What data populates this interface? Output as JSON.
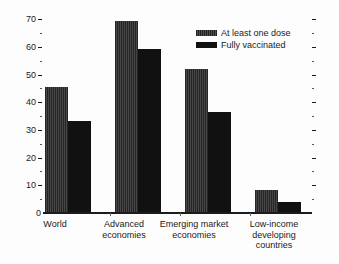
{
  "chart_data": {
    "type": "bar",
    "title": "",
    "subtitle": "",
    "xlabel": "",
    "ylabel": "",
    "ylim": [
      0,
      70
    ],
    "y_ticks": [
      0,
      10,
      20,
      30,
      40,
      50,
      60,
      70
    ],
    "y_minor_ticks": [
      5,
      15,
      25,
      35,
      45,
      55,
      65
    ],
    "grid": false,
    "legend_position": "top-right",
    "categories": [
      "World",
      "Advanced economies",
      "Emerging market economies",
      "Low-income developing countries"
    ],
    "category_lines": [
      [
        "World"
      ],
      [
        "Advanced",
        "economies"
      ],
      [
        "Emerging market",
        "economies"
      ],
      [
        "Low-income",
        "developing",
        "countries"
      ]
    ],
    "series": [
      {
        "name": "At least one dose",
        "color": "#3b3b3b",
        "values": [
          44,
          67,
          50,
          8
        ]
      },
      {
        "name": "Fully vaccinated",
        "color": "#111111",
        "values": [
          32,
          57,
          35,
          4
        ]
      }
    ]
  },
  "axis": {
    "tick_labels": [
      "70",
      "60",
      "50",
      "40",
      "30",
      "20",
      "10",
      "0"
    ]
  },
  "legend": {
    "items": [
      {
        "label": "At least one dose",
        "swatch": "hatched-dark-gray"
      },
      {
        "label": "Fully vaccinated",
        "swatch": "solid-black"
      }
    ]
  }
}
